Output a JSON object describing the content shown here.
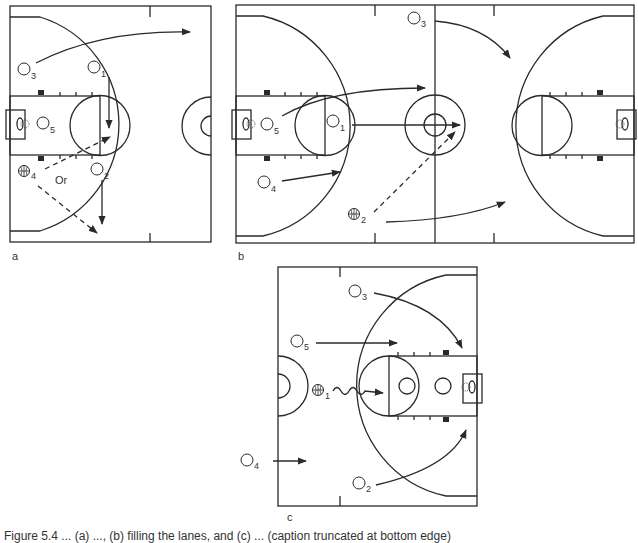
{
  "figure": {
    "panels": [
      {
        "id": "a",
        "label": "a",
        "view": "half-court, basket left",
        "players": [
          {
            "number": "1",
            "has_ball": false
          },
          {
            "number": "2",
            "has_ball": false
          },
          {
            "number": "3",
            "has_ball": false
          },
          {
            "number": "4",
            "has_ball": true
          },
          {
            "number": "5",
            "has_ball": false
          }
        ],
        "annotations": [
          "Or"
        ],
        "movements": [
          {
            "from": "3",
            "type": "cut",
            "direction": "across top to right"
          },
          {
            "from": "1",
            "type": "cut",
            "direction": "down to free-throw line"
          },
          {
            "from": "2",
            "type": "cut",
            "direction": "down"
          },
          {
            "from": "4",
            "type": "pass",
            "style": "dashed",
            "to": "1"
          },
          {
            "from": "4",
            "type": "pass",
            "style": "dashed",
            "to": "2"
          }
        ]
      },
      {
        "id": "b",
        "label": "b",
        "view": "full court",
        "players": [
          {
            "number": "1",
            "has_ball": false
          },
          {
            "number": "2",
            "has_ball": true
          },
          {
            "number": "3",
            "has_ball": false
          },
          {
            "number": "4",
            "has_ball": false
          },
          {
            "number": "5",
            "has_ball": false
          }
        ],
        "movements": [
          {
            "from": "5",
            "type": "cut",
            "direction": "up-court"
          },
          {
            "from": "1",
            "type": "cut",
            "direction": "to center circle"
          },
          {
            "from": "4",
            "type": "cut"
          },
          {
            "from": "3",
            "type": "cut",
            "direction": "toward opposite key"
          },
          {
            "from": "2",
            "type": "cut",
            "direction": "up sideline"
          },
          {
            "from": "2",
            "type": "pass",
            "style": "dashed",
            "to": "center circle"
          }
        ]
      },
      {
        "id": "c",
        "label": "c",
        "view": "half-court, basket right",
        "players": [
          {
            "number": "1",
            "has_ball": true
          },
          {
            "number": "2",
            "has_ball": false
          },
          {
            "number": "3",
            "has_ball": false
          },
          {
            "number": "4",
            "has_ball": false
          },
          {
            "number": "5",
            "has_ball": false
          }
        ],
        "movements": [
          {
            "from": "1",
            "type": "dribble",
            "direction": "to free-throw line"
          },
          {
            "from": "3",
            "type": "cut",
            "direction": "to basket"
          },
          {
            "from": "5",
            "type": "cut"
          },
          {
            "from": "4",
            "type": "cut"
          },
          {
            "from": "2",
            "type": "cut",
            "direction": "to basket"
          }
        ]
      }
    ],
    "caption": "Figure 5.4 ... (a) ..., (b) filling the lanes, and (c) ... (caption truncated at bottom edge)"
  },
  "colors": {
    "line": "#2a2a2a",
    "background": "#ffffff"
  }
}
